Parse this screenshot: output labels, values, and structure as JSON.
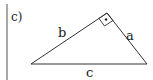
{
  "figure": {
    "part_label": "c)",
    "shape": "right-triangle",
    "sides": {
      "hypotenuse": "c",
      "left_leg": "b",
      "right_leg": "a"
    },
    "right_angle_marker": "square-with-dot",
    "colors": {
      "stroke": "#333333",
      "background": "#ffffff"
    }
  }
}
